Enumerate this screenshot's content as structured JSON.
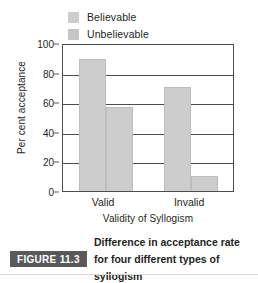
{
  "chart_data": {
    "type": "bar",
    "title": "",
    "categories": [
      "Valid",
      "Invalid"
    ],
    "series": [
      {
        "name": "Believable",
        "values": [
          89,
          70
        ]
      },
      {
        "name": "Unbelievable",
        "values": [
          57,
          10
        ]
      }
    ],
    "xlabel": "Validity of Syllogism",
    "ylabel": "Per cent acceptance",
    "ylim": [
      0,
      100
    ],
    "yticks": [
      100,
      80,
      60,
      40,
      20,
      0
    ],
    "ytick_labels": [
      "100",
      "80",
      "60",
      "40",
      "20",
      "0"
    ],
    "grid": "horizontal",
    "legend_position": "top-left",
    "bar_color": "#cdcdcd",
    "bar_edge_color": "#bdbdbd",
    "axis_color": "#4d4d4f"
  },
  "legend": {
    "items": [
      {
        "label": "Believable",
        "color": "#cdcdcd"
      },
      {
        "label": "Unbelievable",
        "color": "#c6c6c6"
      }
    ]
  },
  "caption": {
    "tag": "FIGURE 11.3",
    "text": "Difference in acceptance rate for four different types of syllogism",
    "tag_background": "#58595b",
    "tag_color": "#ffffff"
  }
}
